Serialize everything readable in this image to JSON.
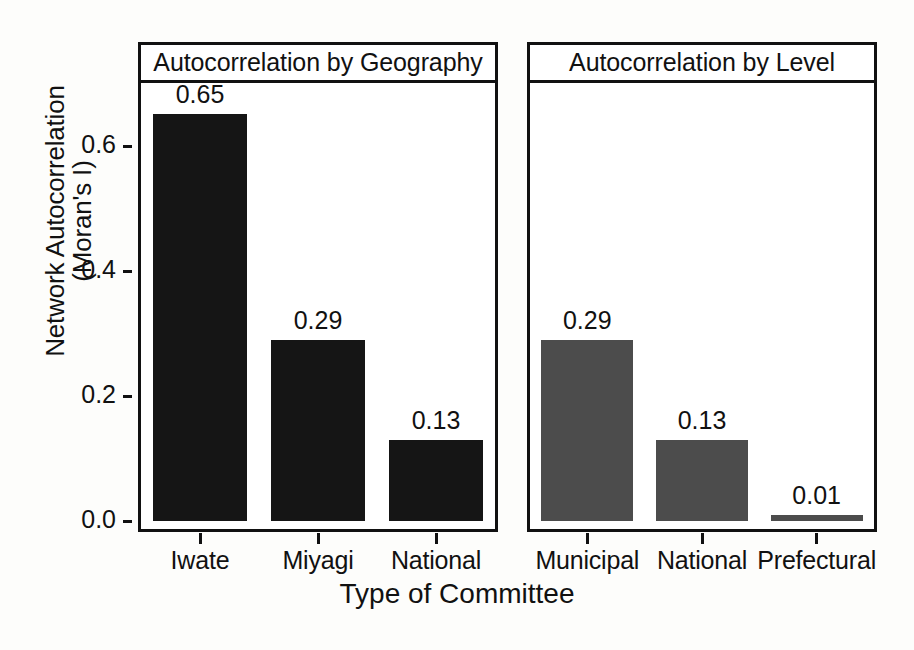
{
  "chart_data": {
    "type": "bar",
    "title": "",
    "xlabel": "Type of Committee",
    "ylabel": "Network Autocorrelation (Moran's I)",
    "ylabel_line1": "Network Autocorrelation",
    "ylabel_line2": "(Moran's I)",
    "ylim": [
      0,
      0.7
    ],
    "yticks": [
      0.0,
      0.2,
      0.4,
      0.6
    ],
    "ytick_labels": [
      "0.0",
      "0.2",
      "0.4",
      "0.6"
    ],
    "grid": false,
    "legend": "none",
    "panel_layout": "horizontal-facets",
    "panels": [
      {
        "strip_label": "Autocorrelation by Geography",
        "bar_color": "#151515",
        "categories": [
          "Iwate",
          "Miyagi",
          "National"
        ],
        "values": [
          0.65,
          0.29,
          0.13
        ],
        "value_labels": [
          "0.65",
          "0.29",
          "0.13"
        ]
      },
      {
        "strip_label": "Autocorrelation by Level",
        "bar_color": "#4c4c4c",
        "categories": [
          "Municipal",
          "National",
          "Prefectural"
        ],
        "values": [
          0.29,
          0.13,
          0.01
        ],
        "value_labels": [
          "0.29",
          "0.13",
          "0.01"
        ]
      }
    ]
  },
  "colors": {
    "axis": "#111111",
    "panel_background": "#ffffff",
    "page_background": "#fdfdfb",
    "bar_dark": "#151515",
    "bar_gray": "#4c4c4c"
  },
  "artifacts": {
    "bleed_text": "Scanned page show-through"
  }
}
